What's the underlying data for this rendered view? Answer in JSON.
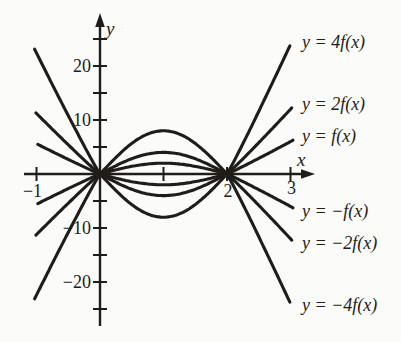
{
  "figure": {
    "background": "#fbfbf9",
    "ink": "#1f1d1a"
  },
  "chart_data": {
    "type": "line",
    "title": "",
    "xlabel": "x",
    "ylabel": "y",
    "x_axis": {
      "label": "x",
      "range": [
        -1.25,
        3.35
      ],
      "ticks": [
        -1,
        1,
        2,
        3
      ],
      "tick_labels": [
        {
          "value": -1,
          "text": "−1"
        },
        {
          "value": 2,
          "text": "2"
        },
        {
          "value": 3,
          "text": "3"
        }
      ],
      "grid": false
    },
    "y_axis": {
      "label": "y",
      "range": [
        -28,
        29
      ],
      "ticks": [
        -25,
        -20,
        -15,
        -10,
        -5,
        5,
        10,
        15,
        20,
        25
      ],
      "tick_labels": [
        {
          "value": 20,
          "text": "20"
        },
        {
          "value": 10,
          "text": "10"
        },
        {
          "value": -10,
          "text": "−10"
        },
        {
          "value": -20,
          "text": "−20"
        }
      ],
      "grid": false
    },
    "base_function": {
      "zeros": [
        0,
        2
      ],
      "peak": {
        "x": 1,
        "y": 2
      },
      "mid_amplitude": 2,
      "mid": "f(x) = 2·sin(πx/2) on [0,2]",
      "left": {
        "coef": 5.6,
        "pow": 1.05
      },
      "right": {
        "coef": 6.0,
        "pow": 1.05
      }
    },
    "series": [
      {
        "name": "4f",
        "label": "y = 4f(x)",
        "scale": 4,
        "x_range": [
          -1.03,
          2.99
        ],
        "key_points": [
          [
            -1,
            22.4
          ],
          [
            0,
            0
          ],
          [
            1,
            8
          ],
          [
            2,
            0
          ],
          [
            2.99,
            23.8
          ]
        ]
      },
      {
        "name": "2f",
        "label": "y = 2f(x)",
        "scale": 2,
        "x_range": [
          -1.01,
          3.02
        ],
        "key_points": [
          [
            -1,
            11.2
          ],
          [
            0,
            0
          ],
          [
            1,
            4
          ],
          [
            2,
            0
          ],
          [
            3.02,
            12.2
          ]
        ]
      },
      {
        "name": "f",
        "label": "y = f(x)",
        "scale": 1,
        "x_range": [
          -0.98,
          3.04
        ],
        "key_points": [
          [
            -0.98,
            5.5
          ],
          [
            0,
            0
          ],
          [
            1,
            2
          ],
          [
            2,
            0
          ],
          [
            3.04,
            6.3
          ]
        ]
      },
      {
        "name": "minus-f",
        "label": "y = −f(x)",
        "scale": -1,
        "x_range": [
          -0.98,
          3.04
        ],
        "key_points": [
          [
            -0.98,
            -5.5
          ],
          [
            0,
            0
          ],
          [
            1,
            -2
          ],
          [
            2,
            0
          ],
          [
            3.04,
            -6.3
          ]
        ]
      },
      {
        "name": "minus-2f",
        "label": "y = −2f(x)",
        "scale": -2,
        "x_range": [
          -1.01,
          3.02
        ],
        "key_points": [
          [
            -1,
            -11.2
          ],
          [
            0,
            0
          ],
          [
            1,
            -4
          ],
          [
            2,
            0
          ],
          [
            3.02,
            -12.2
          ]
        ]
      },
      {
        "name": "minus-4f",
        "label": "y = −4f(x)",
        "scale": -4,
        "x_range": [
          -1.03,
          2.99
        ],
        "key_points": [
          [
            -1,
            -22.4
          ],
          [
            0,
            0
          ],
          [
            1,
            -8
          ],
          [
            2,
            0
          ],
          [
            2.99,
            -23.8
          ]
        ]
      }
    ],
    "legend_position": "labels at right-hand curve ends"
  }
}
